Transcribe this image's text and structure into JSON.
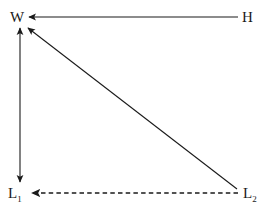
{
  "diagram": {
    "type": "directed-graph",
    "background_color": "#ffffff",
    "stroke_color": "#1a1a1a",
    "width": 273,
    "height": 215,
    "nodes": [
      {
        "id": "W",
        "label": "W",
        "subscript": "",
        "position": "top-left",
        "x": 20,
        "y": 17
      },
      {
        "id": "H",
        "label": "H",
        "subscript": "",
        "position": "top-right",
        "x": 248,
        "y": 17
      },
      {
        "id": "L1",
        "label": "L",
        "subscript": "1",
        "position": "bottom-left",
        "x": 20,
        "y": 193
      },
      {
        "id": "L2",
        "label": "L",
        "subscript": "2",
        "position": "bottom-right",
        "x": 248,
        "y": 193
      }
    ],
    "edges": [
      {
        "id": "h-to-w",
        "from": "H",
        "to": "W",
        "style": "solid",
        "orientation": "horizontal",
        "arrowheads": "target",
        "x1": 238,
        "y1": 17,
        "x2": 27,
        "y2": 17
      },
      {
        "id": "w-to-l1",
        "from": "W",
        "to": "L1",
        "style": "solid",
        "orientation": "vertical",
        "arrowheads": "both",
        "x1": 20,
        "y1": 26,
        "x2": 20,
        "y2": 184
      },
      {
        "id": "l2-to-w",
        "from": "L2",
        "to": "W",
        "style": "solid",
        "orientation": "diagonal",
        "arrowheads": "target",
        "x1": 237,
        "y1": 189,
        "x2": 26,
        "y2": 26
      },
      {
        "id": "l2-to-l1",
        "from": "L2",
        "to": "L1",
        "style": "dashed",
        "orientation": "horizontal",
        "arrowheads": "target",
        "x1": 238,
        "y1": 193,
        "x2": 30,
        "y2": 193
      }
    ]
  }
}
